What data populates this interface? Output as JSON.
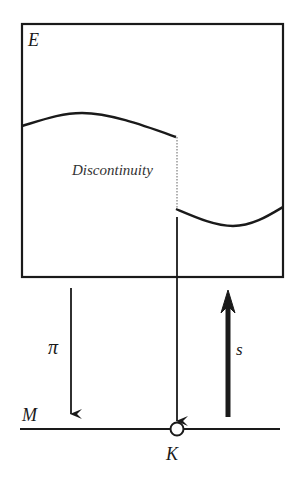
{
  "diagram": {
    "type": "fiber-bundle-section",
    "labels": {
      "total_space": "E",
      "base_space": "M",
      "projection": "π",
      "section": "s",
      "point": "K",
      "discontinuity": "Discontinuity"
    },
    "colors": {
      "stroke": "#1a1a1a",
      "dotted": "#888888",
      "background": "#ffffff"
    }
  }
}
